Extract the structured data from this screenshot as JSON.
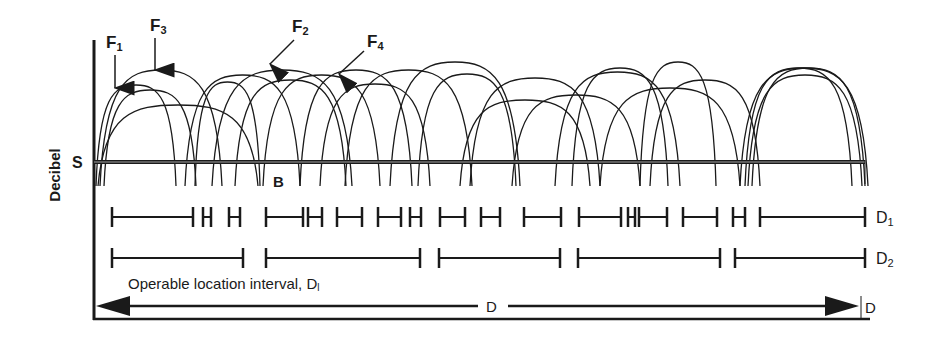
{
  "figure": {
    "ylabel": "Decibel",
    "threshold_label": "S",
    "boundary_label": "B",
    "frequency_labels": [
      {
        "name": "F",
        "sub": "1"
      },
      {
        "name": "F",
        "sub": "3"
      },
      {
        "name": "F",
        "sub": "2"
      },
      {
        "name": "F",
        "sub": "4"
      }
    ],
    "row_labels": {
      "d1": {
        "name": "D",
        "sub": "1"
      },
      "d2": {
        "name": "D",
        "sub": "2"
      }
    },
    "interval_caption": {
      "text": "Operable location interval, D",
      "sub": "l"
    },
    "total_distance_label": "D",
    "end_label": "D",
    "colors": {
      "ink": "#1a1a1a",
      "background": "#ffffff"
    }
  },
  "diagram_data": {
    "d1_intervals": [
      [
        112,
        193
      ],
      [
        203,
        211
      ],
      [
        229,
        240
      ],
      [
        266,
        303
      ],
      [
        308,
        322
      ],
      [
        337,
        362
      ],
      [
        378,
        401
      ],
      [
        410,
        421
      ],
      [
        440,
        465
      ],
      [
        481,
        500
      ],
      [
        524,
        561
      ],
      [
        579,
        621
      ],
      [
        628,
        635
      ],
      [
        639,
        667
      ],
      [
        683,
        717
      ],
      [
        733,
        745
      ],
      [
        760,
        865
      ]
    ],
    "d2_intervals": [
      [
        112,
        243
      ],
      [
        266,
        420
      ],
      [
        439,
        560
      ],
      [
        578,
        720
      ],
      [
        735,
        865
      ]
    ],
    "arches": [
      [
        96,
        85,
        176
      ],
      [
        100,
        70,
        222
      ],
      [
        104,
        90,
        196
      ],
      [
        98,
        105,
        258
      ],
      [
        185,
        75,
        300
      ],
      [
        212,
        70,
        352
      ],
      [
        195,
        82,
        260
      ],
      [
        235,
        80,
        346
      ],
      [
        263,
        75,
        380
      ],
      [
        300,
        70,
        412
      ],
      [
        320,
        84,
        430
      ],
      [
        345,
        70,
        472
      ],
      [
        390,
        62,
        520
      ],
      [
        418,
        74,
        516
      ],
      [
        460,
        100,
        590
      ],
      [
        470,
        78,
        600
      ],
      [
        512,
        95,
        640
      ],
      [
        555,
        72,
        680
      ],
      [
        572,
        68,
        668
      ],
      [
        600,
        88,
        740
      ],
      [
        640,
        62,
        716
      ],
      [
        650,
        80,
        760
      ],
      [
        745,
        68,
        852
      ],
      [
        748,
        75,
        862
      ],
      [
        752,
        68,
        865
      ],
      [
        740,
        68,
        868
      ]
    ]
  }
}
